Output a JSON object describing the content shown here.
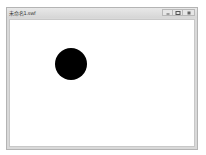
{
  "window": {
    "title": "未命名1.swf",
    "controls": {
      "minimize_label": "",
      "maximize_label": "",
      "close_label": ""
    }
  },
  "stage": {
    "background": "#ffffff",
    "shapes": [
      {
        "type": "circle",
        "fill": "#000000",
        "center_x": 71,
        "center_y": 64,
        "diameter": 32
      }
    ]
  }
}
